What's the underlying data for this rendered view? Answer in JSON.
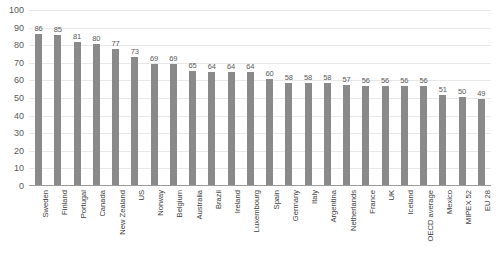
{
  "chart_data": {
    "type": "bar",
    "title": "",
    "subtitle": "",
    "xlabel": "",
    "ylabel": "",
    "ylim": [
      0,
      100
    ],
    "ytick_step": 10,
    "yticks": [
      100,
      90,
      80,
      70,
      60,
      50,
      40,
      30,
      20,
      10,
      0
    ],
    "grid": true,
    "legend": false,
    "legend_position": "none",
    "bar_color": "#8a8a8a",
    "gridline_color": "#e8e8e8",
    "axis_color": "#9c9c9c",
    "label_color": "#595959",
    "show_data_labels": true,
    "categories": [
      "Sweden",
      "Finland",
      "Portugal",
      "Canada",
      "New Zealand",
      "US",
      "Norway",
      "Belgium",
      "Australia",
      "Brazil",
      "Ireland",
      "Luxembourg",
      "Spain",
      "Germany",
      "Italy",
      "Argentina",
      "Netherlands",
      "France",
      "UK",
      "Iceland",
      "OECD average",
      "Mexico",
      "MIPEX 52",
      "EU 28"
    ],
    "values": [
      86,
      85,
      81,
      80,
      77,
      73,
      69,
      69,
      65,
      64,
      64,
      64,
      60,
      58,
      58,
      58,
      57,
      56,
      56,
      56,
      56,
      51,
      50,
      49
    ]
  }
}
